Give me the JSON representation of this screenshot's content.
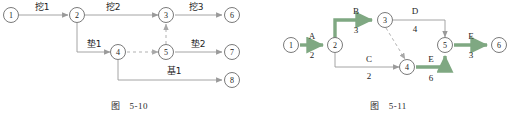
{
  "page": {
    "background": "#ffffff",
    "accent_critical": "#7fa882",
    "line_color": "#9a9a9a"
  },
  "figures": [
    {
      "id": "figure-5-10",
      "caption_prefix": "图",
      "caption_number": "5-10",
      "nodes": [
        {
          "id": "n1",
          "label": "1"
        },
        {
          "id": "n2",
          "label": "2"
        },
        {
          "id": "n3",
          "label": "3"
        },
        {
          "id": "n4",
          "label": "4"
        },
        {
          "id": "n5",
          "label": "5"
        },
        {
          "id": "n6",
          "label": "6"
        },
        {
          "id": "n7",
          "label": "7"
        },
        {
          "id": "n8",
          "label": "8"
        }
      ],
      "edges": [
        {
          "from": "1",
          "to": "2",
          "label": "挖1",
          "style": "solid"
        },
        {
          "from": "2",
          "to": "3",
          "label": "挖2",
          "style": "solid"
        },
        {
          "from": "3",
          "to": "6",
          "label": "挖3",
          "style": "solid"
        },
        {
          "from": "2",
          "to": "4",
          "label": "垫1",
          "style": "solid"
        },
        {
          "from": "4",
          "to": "5",
          "label": "",
          "style": "dashed"
        },
        {
          "from": "5",
          "to": "3",
          "label": "",
          "style": "dashed"
        },
        {
          "from": "5",
          "to": "7",
          "label": "垫2",
          "style": "solid"
        },
        {
          "from": "4",
          "to": "8",
          "label": "基1",
          "style": "solid"
        }
      ]
    },
    {
      "id": "figure-5-11",
      "caption_prefix": "图",
      "caption_number": "5-11",
      "nodes": [
        {
          "id": "n1",
          "label": "1"
        },
        {
          "id": "n2",
          "label": "2"
        },
        {
          "id": "n3",
          "label": "3"
        },
        {
          "id": "n4",
          "label": "4"
        },
        {
          "id": "n5",
          "label": "5"
        },
        {
          "id": "n6",
          "label": "6"
        }
      ],
      "edges": [
        {
          "from": "1",
          "to": "2",
          "label": "A",
          "duration": "2",
          "critical": true
        },
        {
          "from": "2",
          "to": "3",
          "label": "B",
          "duration": "3",
          "critical": true
        },
        {
          "from": "2",
          "to": "4",
          "label": "C",
          "duration": "2",
          "critical": false
        },
        {
          "from": "3",
          "to": "5",
          "label": "D",
          "duration": "4",
          "critical": false
        },
        {
          "from": "3",
          "to": "4",
          "label": "",
          "duration": "",
          "critical": false,
          "style": "dashed"
        },
        {
          "from": "4",
          "to": "5",
          "label": "E",
          "duration": "6",
          "critical": true
        },
        {
          "from": "5",
          "to": "6",
          "label": "E",
          "duration": "3",
          "critical": true
        }
      ]
    }
  ]
}
